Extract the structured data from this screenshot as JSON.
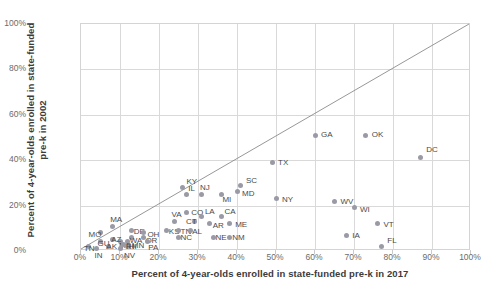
{
  "chart_data": {
    "type": "scatter",
    "title": "",
    "xlabel": "Percent of 4-year-olds enrolled in state-funded pre-k in 2017",
    "ylabel": "Percent of 4-year-olds enrolled in state-funded pre-k in 2002",
    "xlim": [
      0,
      100
    ],
    "ylim": [
      0,
      100
    ],
    "xticks": [
      "0%",
      "10%",
      "20%",
      "30%",
      "40%",
      "50%",
      "60%",
      "70%",
      "80%",
      "90%",
      "100%"
    ],
    "yticks": [
      "0%",
      "20%",
      "40%",
      "60%",
      "80%",
      "100%"
    ],
    "grid": true,
    "legend": "none",
    "annotations": [
      "diagonal y = x reference line"
    ],
    "point_color": "#9a9aa6",
    "points": [
      {
        "label": "DC",
        "x": 87,
        "y": 41,
        "lx": 6,
        "ly": -13
      },
      {
        "label": "OK",
        "x": 73,
        "y": 51,
        "lx": 6,
        "ly": -5
      },
      {
        "label": "GA",
        "x": 60,
        "y": 51,
        "lx": 6,
        "ly": -5
      },
      {
        "label": "TX",
        "x": 49,
        "y": 39,
        "lx": 6,
        "ly": -4
      },
      {
        "label": "NY",
        "x": 50,
        "y": 23,
        "lx": 6,
        "ly": -4
      },
      {
        "label": "WV",
        "x": 65,
        "y": 22,
        "lx": 6,
        "ly": -4
      },
      {
        "label": "WI",
        "x": 70,
        "y": 19,
        "lx": 6,
        "ly": -3
      },
      {
        "label": "VT",
        "x": 76,
        "y": 12,
        "lx": 6,
        "ly": -4
      },
      {
        "label": "IA",
        "x": 68,
        "y": 7,
        "lx": 6,
        "ly": -4
      },
      {
        "label": "FL",
        "x": 77,
        "y": 2,
        "lx": 6,
        "ly": -10
      },
      {
        "label": "SC",
        "x": 41,
        "y": 29,
        "lx": 5,
        "ly": -9
      },
      {
        "label": "MD",
        "x": 40,
        "y": 26,
        "lx": 5,
        "ly": -3
      },
      {
        "label": "MI",
        "x": 36,
        "y": 25,
        "lx": 1,
        "ly": 1
      },
      {
        "label": "NJ",
        "x": 31,
        "y": 25,
        "lx": -2,
        "ly": -11
      },
      {
        "label": "KY",
        "x": 26,
        "y": 28,
        "lx": 4,
        "ly": -10
      },
      {
        "label": "IL",
        "x": 27,
        "y": 25,
        "lx": 2,
        "ly": -10
      },
      {
        "label": "CO",
        "x": 27,
        "y": 17,
        "lx": 5,
        "ly": -4
      },
      {
        "label": "LA",
        "x": 31,
        "y": 15,
        "lx": 3,
        "ly": -10
      },
      {
        "label": "CA",
        "x": 36,
        "y": 15,
        "lx": 3,
        "ly": -10
      },
      {
        "label": "ME",
        "x": 38,
        "y": 12,
        "lx": 6,
        "ly": -4
      },
      {
        "label": "AR",
        "x": 33,
        "y": 12,
        "lx": 3,
        "ly": -3
      },
      {
        "label": "CT",
        "x": 29,
        "y": 13,
        "lx": -8,
        "ly": -4
      },
      {
        "label": "VA",
        "x": 24,
        "y": 13,
        "lx": -3,
        "ly": -11
      },
      {
        "label": "KS",
        "x": 22,
        "y": 9,
        "lx": 2,
        "ly": -4
      },
      {
        "label": "TN",
        "x": 25,
        "y": 9,
        "lx": 2,
        "ly": -4
      },
      {
        "label": "AL",
        "x": 28,
        "y": 9,
        "lx": 2,
        "ly": -4
      },
      {
        "label": "NC",
        "x": 25,
        "y": 6,
        "lx": 2,
        "ly": 0
      },
      {
        "label": "NE",
        "x": 34,
        "y": 6,
        "lx": 2,
        "ly": 0
      },
      {
        "label": "NM",
        "x": 38,
        "y": 6,
        "lx": 3,
        "ly": 0
      },
      {
        "label": "MA",
        "x": 8,
        "y": 11,
        "lx": -2,
        "ly": -11
      },
      {
        "label": "MO",
        "x": 5,
        "y": 8,
        "lx": -12,
        "ly": -3
      },
      {
        "label": "DE",
        "x": 13,
        "y": 9,
        "lx": 2,
        "ly": -4
      },
      {
        "label": "OH",
        "x": 16,
        "y": 8,
        "lx": 4,
        "ly": -3
      },
      {
        "label": "WA",
        "x": 13,
        "y": 6,
        "lx": -2,
        "ly": -1
      },
      {
        "label": "OR",
        "x": 16,
        "y": 6,
        "lx": 2,
        "ly": -1
      },
      {
        "label": "PA",
        "x": 17,
        "y": 4,
        "lx": 1,
        "ly": 1
      },
      {
        "label": "MN",
        "x": 12,
        "y": 4,
        "lx": 0,
        "ly": -1
      },
      {
        "label": "MS",
        "x": 10,
        "y": 4,
        "lx": -1,
        "ly": -1
      },
      {
        "label": "AZ",
        "x": 8,
        "y": 5,
        "lx": -1,
        "ly": -5
      },
      {
        "label": "GU",
        "x": 5,
        "y": 4,
        "lx": -3,
        "ly": -3
      },
      {
        "label": "TN2",
        "x": 2,
        "y": 2,
        "lx": -5,
        "ly": -2
      },
      {
        "label": "IN",
        "x": 4,
        "y": 1,
        "lx": -2,
        "ly": 2
      },
      {
        "label": "AK",
        "x": 7,
        "y": 2,
        "lx": -2,
        "ly": 0
      },
      {
        "label": "NV",
        "x": 10,
        "y": 1,
        "lx": 0,
        "ly": 2
      },
      {
        "label": "HI",
        "x": 12,
        "y": 2,
        "lx": 1,
        "ly": 0
      },
      {
        "label": "RI",
        "x": 11,
        "y": 3,
        "lx": 2,
        "ly": -2
      }
    ]
  }
}
